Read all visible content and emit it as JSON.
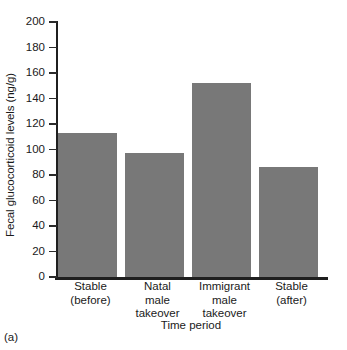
{
  "panel": {
    "label": "(a)"
  },
  "chart_data": {
    "type": "bar",
    "title": "",
    "categories": [
      "Stable\n(before)",
      "Natal\nmale\ntakeover",
      "Immigrant\nmale\ntakeover",
      "Stable\n(after)"
    ],
    "category_lines": [
      [
        "Stable",
        "(before)"
      ],
      [
        "Natal",
        "male",
        "takeover"
      ],
      [
        "Immigrant",
        "male",
        "takeover"
      ],
      [
        "Stable",
        "(after)"
      ]
    ],
    "values": [
      113,
      97,
      152,
      86
    ],
    "xlabel": "Time period",
    "ylabel": "Fecal glucocorticoid levels (ng/g)",
    "ylim": [
      0,
      200
    ],
    "yticks": [
      0,
      20,
      40,
      60,
      80,
      100,
      120,
      140,
      160,
      180,
      200
    ],
    "ytick_labels": [
      "0",
      "20",
      "40",
      "60",
      "80",
      "100",
      "120",
      "140",
      "160",
      "180",
      "200"
    ],
    "grid": false,
    "legend": false,
    "bar_color": "#787878",
    "axis_color": "#1f1f1f",
    "background": "#ffffff"
  }
}
